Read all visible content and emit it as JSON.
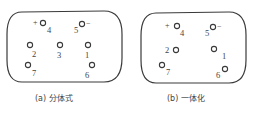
{
  "diagrams": [
    {
      "id": "a",
      "caption": "(a) 分体式",
      "pins": [
        {
          "num": "4",
          "sign": "+",
          "cx": 43,
          "cy": 25
        },
        {
          "num": "5",
          "sign": "−",
          "cx": 82,
          "cy": 25
        },
        {
          "num": "2",
          "cx": 30,
          "cy": 45
        },
        {
          "num": "3",
          "cx": 59,
          "cy": 45
        },
        {
          "num": "1",
          "cx": 88,
          "cy": 45
        },
        {
          "num": "7",
          "cx": 28,
          "cy": 66
        },
        {
          "num": "6",
          "cx": 92,
          "cy": 66
        }
      ]
    },
    {
      "id": "b",
      "caption": "(b) 一体化",
      "pins": [
        {
          "num": "4",
          "sign": "+",
          "cx": 177,
          "cy": 26
        },
        {
          "num": "5",
          "sign": "−",
          "cx": 213,
          "cy": 26
        },
        {
          "num": "2",
          "cx": 176,
          "cy": 48
        },
        {
          "num": "1",
          "cx": 214,
          "cy": 48
        },
        {
          "num": "7",
          "cx": 162,
          "cy": 65
        },
        {
          "num": "6",
          "cx": 225,
          "cy": 68
        }
      ]
    }
  ]
}
